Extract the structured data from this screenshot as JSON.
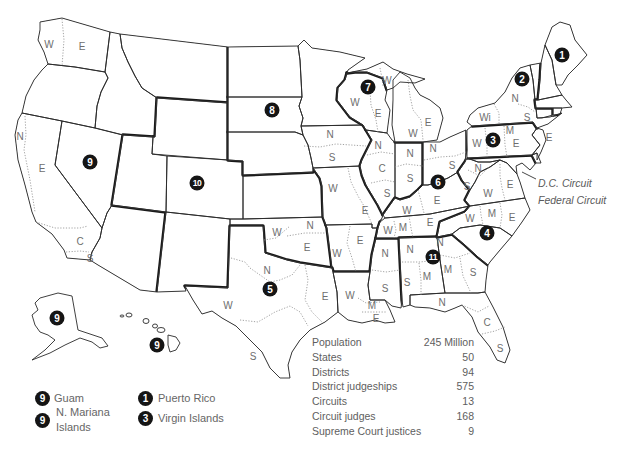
{
  "map": {
    "circuit_markers": [
      "1",
      "2",
      "3",
      "4",
      "5",
      "6",
      "7",
      "8",
      "9",
      "10",
      "11",
      "9",
      "9"
    ],
    "district_labels": {
      "washington": [
        "W",
        "E"
      ],
      "california": [
        "N",
        "E",
        "C",
        "S"
      ],
      "oklahoma": [
        "W",
        "N",
        "E"
      ],
      "texas": [
        "N",
        "W",
        "E",
        "S"
      ],
      "louisiana": [
        "W",
        "M",
        "E"
      ],
      "mississippi": [
        "N",
        "S"
      ],
      "arkansas": [
        "W",
        "E"
      ],
      "missouri": [
        "W",
        "E"
      ],
      "iowa": [
        "N",
        "S"
      ],
      "wisconsin": [
        "W",
        "E"
      ],
      "michigan": [
        "W",
        "E",
        "W"
      ],
      "illinois": [
        "N",
        "C",
        "S"
      ],
      "indiana": [
        "N",
        "S"
      ],
      "ohio": [
        "N",
        "S"
      ],
      "kentucky": [
        "W",
        "E"
      ],
      "tennessee": [
        "W",
        "M",
        "E"
      ],
      "alabama": [
        "N",
        "M",
        "S"
      ],
      "georgia": [
        "N",
        "M",
        "S"
      ],
      "florida": [
        "N",
        "C",
        "S"
      ],
      "north_carolina": [
        "W",
        "M",
        "E"
      ],
      "virginia": [
        "W",
        "E"
      ],
      "west_virginia": [
        "N",
        "S"
      ],
      "pennsylvania": [
        "W",
        "M",
        "E"
      ],
      "new_york": [
        "Wi",
        "N",
        "S",
        "E"
      ]
    },
    "dc_labels": {
      "dc_circuit": "D.C. Circuit",
      "federal_circuit": "Federal Circuit"
    },
    "colors": {
      "marker_fill": "#151515",
      "marker_text": "#ffffff",
      "border_line": "#1a1a1a",
      "district_text": "#6e6e6e",
      "district_divider": "#8a8a8a"
    }
  },
  "legend": {
    "items": [
      {
        "marker": "9",
        "label": "Guam"
      },
      {
        "marker": "9",
        "label": "N. Mariana Islands"
      },
      {
        "marker": "1",
        "label": "Puerto Rico"
      },
      {
        "marker": "3",
        "label": "Virgin Islands"
      }
    ]
  },
  "stats": {
    "rows": [
      {
        "label": "Population",
        "value": "245 Million"
      },
      {
        "label": "States",
        "value": "50"
      },
      {
        "label": "Districts",
        "value": "94"
      },
      {
        "label": "District judgeships",
        "value": "575"
      },
      {
        "label": "Circuits",
        "value": "13"
      },
      {
        "label": "Circuit judges",
        "value": "168"
      },
      {
        "label": "Supreme Court justices",
        "value": "9"
      }
    ]
  }
}
